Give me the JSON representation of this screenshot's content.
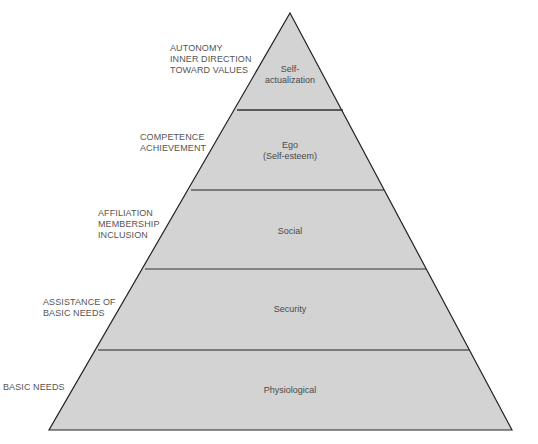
{
  "diagram": {
    "type": "pyramid",
    "title": "",
    "colors": {
      "fill": "#d3d3d3",
      "stroke": "#222222",
      "text": "#4a4a4a",
      "label": "#555555",
      "background": "#ffffff"
    },
    "tiers": [
      {
        "level": 5,
        "name": [
          "Self-",
          "actualization"
        ],
        "side_label": [
          "AUTONOMY",
          "INNER DIRECTION",
          "TOWARD VALUES"
        ]
      },
      {
        "level": 4,
        "name": [
          "Ego",
          "(Self-esteem)"
        ],
        "side_label": [
          "COMPETENCE",
          "ACHIEVEMENT"
        ]
      },
      {
        "level": 3,
        "name": [
          "Social"
        ],
        "side_label": [
          "AFFILIATION",
          "MEMBERSHIP",
          "INCLUSION"
        ]
      },
      {
        "level": 2,
        "name": [
          "Security"
        ],
        "side_label": [
          "ASSISTANCE OF",
          "BASIC NEEDS"
        ]
      },
      {
        "level": 1,
        "name": [
          "Physiological"
        ],
        "side_label": [
          "BASIC NEEDS"
        ]
      }
    ]
  },
  "labels": {
    "t5": {
      "line1": "Self-",
      "line2": "actualization",
      "side1": "AUTONOMY",
      "side2": "INNER DIRECTION",
      "side3": "TOWARD VALUES"
    },
    "t4": {
      "line1": "Ego",
      "line2": "(Self-esteem)",
      "side1": "COMPETENCE",
      "side2": "ACHIEVEMENT"
    },
    "t3": {
      "line1": "Social",
      "side1": "AFFILIATION",
      "side2": "MEMBERSHIP",
      "side3": "INCLUSION"
    },
    "t2": {
      "line1": "Security",
      "side1": "ASSISTANCE OF",
      "side2": "BASIC NEEDS"
    },
    "t1": {
      "line1": "Physiological",
      "side1": "BASIC NEEDS"
    }
  }
}
